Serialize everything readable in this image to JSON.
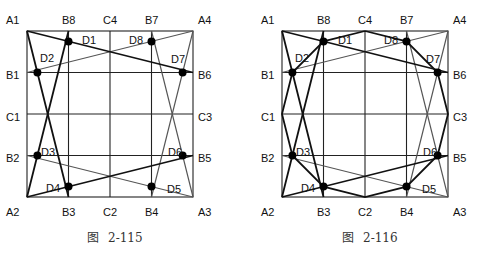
{
  "figures": [
    {
      "id": "fig-2-115",
      "caption_prefix": "图",
      "caption_number": "2-115",
      "corner_labels": {
        "A1": "A1",
        "A2": "A2",
        "A3": "A3",
        "A4": "A4"
      },
      "edge_labels": {
        "B1": "B1",
        "B2": "B2",
        "B3": "B3",
        "B4": "B4",
        "B5": "B5",
        "B6": "B6",
        "B7": "B7",
        "B8": "B8",
        "C1": "C1",
        "C2": "C2",
        "C3": "C3",
        "C4": "C4"
      },
      "point_labels": {
        "D1": "D1",
        "D2": "D2",
        "D3": "D3",
        "D4": "D4",
        "D5": "D5",
        "D6": "D6",
        "D7": "D7",
        "D8": "D8"
      }
    },
    {
      "id": "fig-2-116",
      "caption_prefix": "图",
      "caption_number": "2-116",
      "corner_labels": {
        "A1": "A1",
        "A2": "A2",
        "A3": "A3",
        "A4": "A4"
      },
      "edge_labels": {
        "B1": "B1",
        "B2": "B2",
        "B3": "B3",
        "B4": "B4",
        "B5": "B5",
        "B6": "B6",
        "B7": "B7",
        "B8": "B8",
        "C1": "C1",
        "C2": "C2",
        "C3": "C3",
        "C4": "C4"
      },
      "point_labels": {
        "D1": "D1",
        "D2": "D2",
        "D3": "D3",
        "D4": "D4",
        "D5": "D5",
        "D6": "D6",
        "D7": "D7",
        "D8": "D8"
      }
    }
  ],
  "colors": {
    "thick_line": "#111111",
    "thin_line": "#555555",
    "grid": "#222222",
    "dot": "#000000"
  }
}
